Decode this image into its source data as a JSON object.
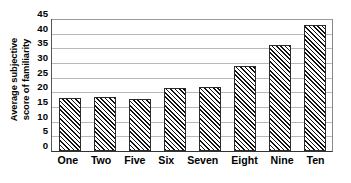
{
  "chart_data": {
    "type": "bar",
    "title": "",
    "subtitle": "",
    "xlabel": "",
    "ylabel": "Average subjective score of familiarity",
    "ylabel_lines": [
      "Average subjective",
      "score of familiarity"
    ],
    "categories": [
      "One",
      "Two",
      "Five",
      "Six",
      "Seven",
      "Eight",
      "Nine",
      "Ten"
    ],
    "values": [
      18,
      18.4,
      17.8,
      21.6,
      21.8,
      29,
      36,
      43
    ],
    "ylim": [
      0,
      45
    ],
    "yticks": [
      0,
      5,
      10,
      15,
      20,
      25,
      30,
      35,
      40,
      45
    ],
    "ytick_labels": [
      "0",
      "5",
      "10",
      "15",
      "20",
      "25",
      "30",
      "35",
      "40",
      "45"
    ],
    "grid": true,
    "grid_axis": "y",
    "legend": null,
    "legend_position": "none",
    "bar_fill": "diagonal-hatch",
    "bar_color": "#000000",
    "bar_background": "#ffffff",
    "grid_color": "#b8b8b8",
    "axis_color": "#333333",
    "plot_background": "#ffffff"
  }
}
